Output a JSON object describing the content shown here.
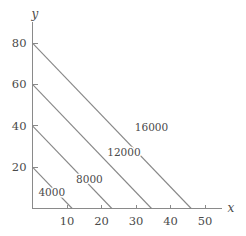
{
  "chart_data": {
    "type": "line",
    "title": "",
    "subtitle": "",
    "xlabel": "x",
    "ylabel": "y",
    "xlim": [
      0,
      55
    ],
    "ylim": [
      0,
      88
    ],
    "grid": false,
    "legend_position": "none",
    "x_ticks": [
      10,
      20,
      30,
      40,
      50
    ],
    "x_tick_labels": [
      "10",
      "20",
      "30",
      "40",
      "50"
    ],
    "y_ticks": [
      20,
      40,
      60,
      80
    ],
    "y_tick_labels": [
      "20",
      "40",
      "60",
      "80"
    ],
    "annotations": [
      "4000",
      "8000",
      "12000",
      "16000"
    ],
    "series": [
      {
        "name": "4000",
        "label": "4000",
        "x": [
          0,
          11.5
        ],
        "y": [
          20,
          0
        ],
        "label_x": 5.6,
        "label_y": 6.2
      },
      {
        "name": "8000",
        "label": "8000",
        "x": [
          0,
          23
        ],
        "y": [
          40,
          0
        ],
        "label_x": 16.5,
        "label_y": 12.5
      },
      {
        "name": "12000",
        "label": "12000",
        "x": [
          0,
          34.5
        ],
        "y": [
          60,
          0
        ],
        "label_x": 26.5,
        "label_y": 25.5
      },
      {
        "name": "16000",
        "label": "16000",
        "x": [
          0,
          46
        ],
        "y": [
          80,
          0
        ],
        "label_x": 34.5,
        "label_y": 37.5
      }
    ]
  },
  "axes": {
    "x_axis_name": "x",
    "y_axis_name": "y"
  },
  "colors": {
    "line": "#888888",
    "axis": "#8a8a8a",
    "text": "#4a4a4a",
    "background": "#ffffff"
  }
}
